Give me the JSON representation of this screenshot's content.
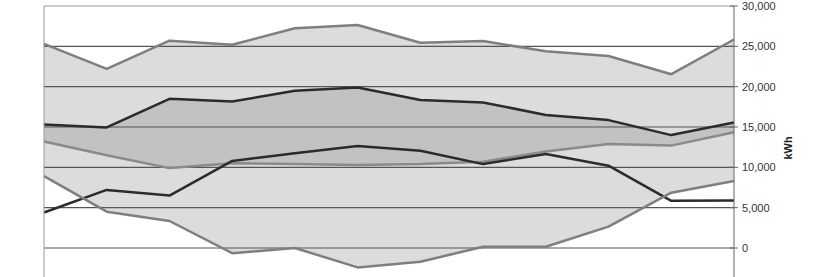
{
  "chart_data": {
    "type": "area",
    "title": "",
    "xlabel": "",
    "ylabel": "kWh",
    "ylim": [
      -3500,
      30000
    ],
    "yticks": [
      0,
      5000,
      10000,
      15000,
      20000,
      25000,
      30000
    ],
    "ytick_labels": [
      "0",
      "5,000",
      "10,000",
      "15,000",
      "20,000",
      "25,000",
      "30,000"
    ],
    "y_axis_position": "right",
    "grid": true,
    "legend": null,
    "x": [
      1,
      2,
      3,
      4,
      5,
      6,
      7,
      8,
      9,
      10,
      11,
      12
    ],
    "bands": [
      {
        "name": "outer-range",
        "fill": "#dcdcdc",
        "upper": "Max",
        "lower": "Min"
      },
      {
        "name": "inner-range",
        "fill": "#c2c2c2",
        "upper": "Upper",
        "lower": "Lower"
      }
    ],
    "series": [
      {
        "name": "Max",
        "color": "#7f7f7f",
        "width": 2.5,
        "values": [
          25300,
          22200,
          25700,
          25200,
          27250,
          27650,
          25450,
          25650,
          24400,
          23800,
          21550,
          25850
        ]
      },
      {
        "name": "Upper",
        "color": "#2b2b2b",
        "width": 2.5,
        "values": [
          15300,
          14950,
          18500,
          18150,
          19500,
          19900,
          18350,
          18050,
          16500,
          15850,
          14000,
          15550
        ]
      },
      {
        "name": "Lower",
        "color": "#8a8a8a",
        "width": 2.5,
        "values": [
          13200,
          11500,
          9900,
          10500,
          10400,
          10300,
          10400,
          10700,
          11950,
          12900,
          12700,
          14350
        ]
      },
      {
        "name": "Actual",
        "color": "#2b2b2b",
        "width": 2.5,
        "values": [
          4400,
          7200,
          6500,
          10800,
          11750,
          12650,
          12050,
          10400,
          11650,
          10200,
          5850,
          5900
        ]
      },
      {
        "name": "Min",
        "color": "#7f7f7f",
        "width": 2.5,
        "values": [
          8900,
          4500,
          3350,
          -650,
          0,
          -2400,
          -1700,
          150,
          150,
          2650,
          6850,
          8300
        ]
      }
    ]
  },
  "layout": {
    "plot_left": 44,
    "plot_right": 734,
    "y_zero_px": 248,
    "y_top_px": 6,
    "y_top_value": 30000,
    "plot_bottom_px": 277,
    "gridline_color": "#555555",
    "frame_color": "#999999"
  }
}
